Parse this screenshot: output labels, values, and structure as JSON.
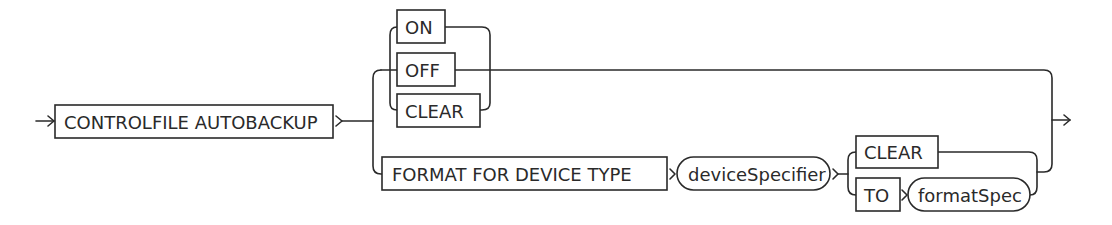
{
  "diagram": {
    "type": "railroad-syntax",
    "colors": {
      "stroke": "#2a2a2a",
      "background": "#ffffff"
    },
    "start": {
      "keyword": "CONTROLFILE AUTOBACKUP"
    },
    "branch_1": {
      "options": [
        {
          "keyword": "ON"
        },
        {
          "keyword": "OFF"
        },
        {
          "keyword": "CLEAR"
        }
      ]
    },
    "branch_2": {
      "keyword": "FORMAT FOR DEVICE TYPE",
      "variable": "deviceSpecifier",
      "options": [
        {
          "keyword": "CLEAR"
        },
        {
          "keyword": "TO",
          "variable": "formatSpec"
        }
      ]
    }
  }
}
